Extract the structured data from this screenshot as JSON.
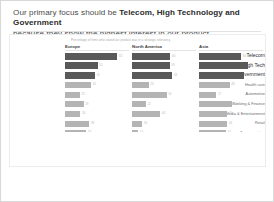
{
  "slide": {
    "headline_prefix": "Our primary focus should be ",
    "headline_emphasis": "Telecom, High Technology and Government",
    "headline_suffix": "because they show the highest interest in our product"
  },
  "chart_data": {
    "type": "bar",
    "orientation": "horizontal",
    "title": "",
    "subtitle": "Percentage of firms who stated our product was in a strategic relevancy",
    "xlabel": "",
    "ylabel": "",
    "grid": false,
    "legend_position": "none",
    "panel_layout": "small-multiples",
    "highlight_categories": [
      "Telecom",
      "High Tech",
      "Government"
    ],
    "colors": {
      "highlight_bar": "#595959",
      "normal_bar": "#b4b4b4",
      "value_label": "#bcbcbc",
      "panel_header": "#3c3c3c",
      "rule": "#e4e4e4"
    },
    "categories": [
      "Telecom",
      "High Tech",
      "Government",
      "Health care",
      "Automotive",
      "Banking & Finance",
      "Media & Entertainment",
      "Retail",
      "Transportation",
      "Education",
      "Tourism & Hospitality"
    ],
    "xlim": [
      0,
      100
    ],
    "panels": [
      "Europe",
      "North America",
      "Asia"
    ],
    "series": [
      {
        "name": "Europe",
        "values": [
          82,
          51,
          47,
          41,
          23,
          29,
          24,
          38,
          33,
          15,
          22
        ],
        "labels": [
          "82",
          "51",
          "47",
          "41",
          "23",
          "29",
          "24",
          "38",
          "33",
          "15",
          "22"
        ]
      },
      {
        "name": "North America",
        "values": [
          60,
          59,
          63,
          26,
          54,
          22,
          44,
          16,
          10,
          30,
          11
        ],
        "labels": [
          "60",
          "59",
          "63",
          "26",
          "54",
          "22",
          "44",
          "16",
          "10",
          "30",
          "11"
        ]
      },
      {
        "name": "Asia",
        "values": [
          66,
          76,
          70,
          48,
          27,
          52,
          44,
          44,
          42,
          41,
          57
        ],
        "labels": [
          "66",
          "76",
          "70",
          "48",
          "27",
          "52",
          "44",
          "44",
          "42",
          "41",
          "57"
        ]
      }
    ]
  }
}
